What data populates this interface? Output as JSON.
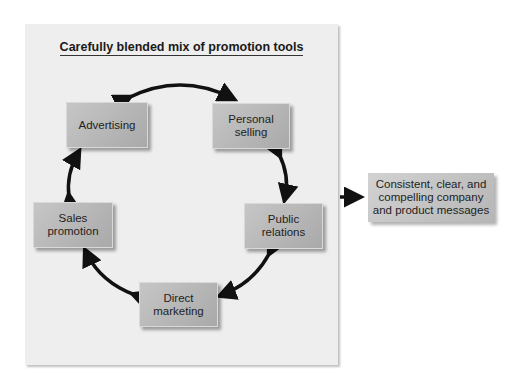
{
  "diagram": {
    "title": "Carefully blended mix of promotion tools",
    "tools": [
      {
        "id": "advertising",
        "label": "Advertising"
      },
      {
        "id": "personal-selling",
        "label": "Personal\nselling"
      },
      {
        "id": "public-relations",
        "label": "Public\nrelations"
      },
      {
        "id": "direct-marketing",
        "label": "Direct\nmarketing"
      },
      {
        "id": "sales-promotion",
        "label": "Sales\npromotion"
      }
    ],
    "cycle_connections": [
      [
        "advertising",
        "personal-selling"
      ],
      [
        "personal-selling",
        "public-relations"
      ],
      [
        "public-relations",
        "direct-marketing"
      ],
      [
        "direct-marketing",
        "sales-promotion"
      ],
      [
        "sales-promotion",
        "advertising"
      ]
    ],
    "output": {
      "label": "Consistent, clear, and\ncompelling company\nand product messages"
    }
  }
}
